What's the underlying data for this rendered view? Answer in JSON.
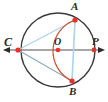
{
  "figure": {
    "background": "#ffffff",
    "width": 108,
    "height": 102
  },
  "colors": {
    "circle_stroke": "#3a3a3a",
    "axis_stroke": "#8a8a8a",
    "chord_stroke": "#a8d4ec",
    "arc_stroke": "#d0512a",
    "point_fill": "#e8322a",
    "label_text": "#2b2b2b"
  },
  "points": [
    {
      "name": "C",
      "label": "C",
      "x": 18,
      "y": 50,
      "label_x": 5,
      "label_y": 37
    },
    {
      "name": "O",
      "label": "O",
      "x": 58,
      "y": 50,
      "label_x": 55,
      "label_y": 37
    },
    {
      "name": "P",
      "label": "P",
      "x": 94,
      "y": 50,
      "label_x": 92,
      "label_y": 37
    },
    {
      "name": "A",
      "label": "A",
      "x": 75,
      "y": 20,
      "label_x": 71,
      "label_y": 1
    },
    {
      "name": "B",
      "label": "B",
      "x": 72,
      "y": 81,
      "label_x": 69,
      "label_y": 88
    }
  ],
  "circle": {
    "cx": 58,
    "cy": 50,
    "r": 37
  },
  "axis": {
    "x1": 4,
    "y1": 50,
    "x2": 104,
    "y2": 50,
    "arrows": "both"
  },
  "chords": [
    {
      "name": "chord-CA",
      "from": "C",
      "to": "A"
    },
    {
      "name": "chord-CB",
      "from": "C",
      "to": "B"
    },
    {
      "name": "chord-AB",
      "from": "A",
      "to": "B"
    }
  ],
  "arc": {
    "name": "arc-AB",
    "from": "A",
    "to": "B",
    "bulge": "left",
    "rx": 33,
    "ry": 33
  }
}
